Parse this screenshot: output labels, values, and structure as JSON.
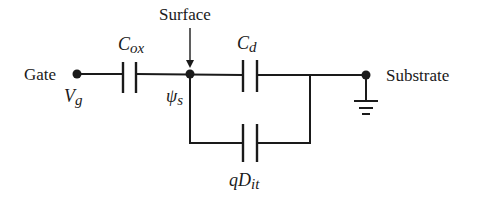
{
  "diagram": {
    "nodes": {
      "gate": {
        "label": "Gate",
        "potential": "V",
        "potential_sub": "g"
      },
      "surface": {
        "label": "Surface",
        "potential": "ψ",
        "potential_sub": "s"
      },
      "substrate": {
        "label": "Substrate"
      }
    },
    "components": {
      "c_ox": {
        "main": "C",
        "sub": "ox",
        "connects": [
          "gate",
          "surface"
        ]
      },
      "c_d": {
        "main": "C",
        "sub": "d",
        "connects": [
          "surface",
          "substrate"
        ]
      },
      "q_dit": {
        "main": "qD",
        "sub": "it",
        "connects": [
          "surface",
          "substrate"
        ],
        "parallel_to": "c_d"
      }
    },
    "ground": {
      "symbol": "ground-icon",
      "attached_to": "substrate"
    },
    "colors": {
      "ink": "#1a1a1a",
      "background": "#ffffff"
    }
  }
}
